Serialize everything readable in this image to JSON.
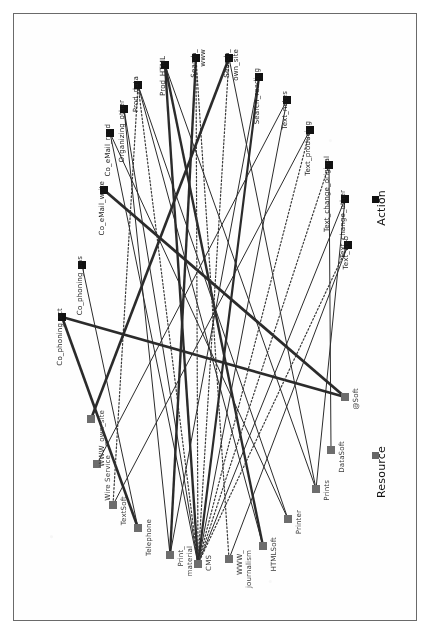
{
  "figure": {
    "orientation": "rotated-90-clockwise",
    "background_color": "#ffffff",
    "frame_color": "#6a6a6a"
  },
  "legend": {
    "items": [
      {
        "label": "Action",
        "marker": "filled-square",
        "color": "#111111",
        "x": 372,
        "y": 196
      },
      {
        "label": "Resource",
        "marker": "filled-square",
        "color": "#666666",
        "x": 372,
        "y": 452
      }
    ]
  },
  "chart_data": {
    "type": "scatter",
    "title": "",
    "xlabel": "",
    "ylabel": "",
    "node_groups": [
      {
        "name": "Action",
        "color": "#111111",
        "marker": "square",
        "size": 8
      },
      {
        "name": "Resource",
        "color": "#6d6d6d",
        "marker": "square",
        "size": 8
      }
    ],
    "nodes": [
      {
        "id": "Co_phoning_act",
        "label": "Co_phoning_act",
        "group": "Action",
        "x": 62,
        "y": 317
      },
      {
        "id": "Co_phoning_pas",
        "label": "Co_phoning_pas",
        "group": "Action",
        "x": 82,
        "y": 265
      },
      {
        "id": "Co_eMail_write",
        "label": "Co_eMail_write",
        "group": "Action",
        "x": 104,
        "y": 190
      },
      {
        "id": "Co_eMail_read",
        "label": "Co_eMail_read",
        "group": "Action",
        "x": 110,
        "y": 133
      },
      {
        "id": "Organizing_other",
        "label": "Organizing_other",
        "group": "Action",
        "x": 124,
        "y": 109
      },
      {
        "id": "Prod_data",
        "label": "Prod_data",
        "group": "Action",
        "x": 138,
        "y": 85
      },
      {
        "id": "Prod_HTML",
        "label": "Prod_HTML",
        "group": "Action",
        "x": 165,
        "y": 65
      },
      {
        "id": "Search_www",
        "label": "Search_www",
        "group": "Action",
        "x": 196,
        "y": 58
      },
      {
        "id": "Search_own_site",
        "label": "Search_own_site",
        "group": "Action",
        "x": 229,
        "y": 58
      },
      {
        "id": "Search_reading",
        "label": "Search_reading",
        "group": "Action",
        "x": 259,
        "y": 77
      },
      {
        "id": "Text_notes",
        "label": "Text_notes",
        "group": "Action",
        "x": 287,
        "y": 100
      },
      {
        "id": "Text_producing",
        "label": "Text_producing",
        "group": "Action",
        "x": 310,
        "y": 130
      },
      {
        "id": "Text_change_original",
        "label": "Text_change_original",
        "group": "Action",
        "x": 329,
        "y": 165
      },
      {
        "id": "Text_change_other",
        "label": "Text_change_other",
        "group": "Action",
        "x": 345,
        "y": 199
      },
      {
        "id": "Text_web",
        "label": "Text_web",
        "group": "Action",
        "x": 348,
        "y": 245
      },
      {
        "id": "WWW_own_site",
        "label": "WWW_own_site",
        "group": "Resource",
        "x": 91,
        "y": 419
      },
      {
        "id": "Wire Service",
        "label": "Wire Service",
        "group": "Resource",
        "x": 97,
        "y": 464
      },
      {
        "id": "TextSoft",
        "label": "TextSoft",
        "group": "Resource",
        "x": 113,
        "y": 505
      },
      {
        "id": "Telephone",
        "label": "Telephone",
        "group": "Resource",
        "x": 138,
        "y": 528
      },
      {
        "id": "Print_material",
        "label": "Print_material",
        "group": "Resource",
        "x": 170,
        "y": 555
      },
      {
        "id": "CMS",
        "label": "CMS",
        "group": "Resource",
        "x": 198,
        "y": 564
      },
      {
        "id": "WWW_journalism",
        "label": "WWW_journalism",
        "group": "Resource",
        "x": 229,
        "y": 559
      },
      {
        "id": "HTMLSoft",
        "label": "HTMLSoft",
        "group": "Resource",
        "x": 263,
        "y": 546
      },
      {
        "id": "Printer",
        "label": "Printer",
        "group": "Resource",
        "x": 288,
        "y": 519
      },
      {
        "id": "Prints",
        "label": "Prints",
        "group": "Resource",
        "x": 316,
        "y": 489
      },
      {
        "id": "DataSoft",
        "label": "DataSoft",
        "group": "Resource",
        "x": 331,
        "y": 450
      },
      {
        "id": "@Soft",
        "label": "@Soft",
        "group": "Resource",
        "x": 345,
        "y": 397
      }
    ],
    "edges": [
      {
        "source": "Co_phoning_act",
        "target": "@Soft",
        "style": "solid",
        "width": 2.6
      },
      {
        "source": "Co_phoning_act",
        "target": "Telephone",
        "style": "solid",
        "width": 2.6
      },
      {
        "source": "Co_phoning_pas",
        "target": "Telephone",
        "style": "solid",
        "width": 1.0
      },
      {
        "source": "Co_eMail_write",
        "target": "@Soft",
        "style": "solid",
        "width": 2.8
      },
      {
        "source": "Co_eMail_read",
        "target": "CMS",
        "style": "solid",
        "width": 1.0
      },
      {
        "source": "Organizing_other",
        "target": "Print_material",
        "style": "solid",
        "width": 1.0
      },
      {
        "source": "Prod_data",
        "target": "CMS",
        "style": "dotted",
        "width": 1.2
      },
      {
        "source": "Prod_data",
        "target": "HTMLSoft",
        "style": "solid",
        "width": 1.0
      },
      {
        "source": "Prod_data",
        "target": "Printer",
        "style": "solid",
        "width": 1.0
      },
      {
        "source": "Prod_data",
        "target": "TextSoft",
        "style": "dotted",
        "width": 1.2
      },
      {
        "source": "Prod_HTML",
        "target": "CMS",
        "style": "solid",
        "width": 2.4
      },
      {
        "source": "Prod_HTML",
        "target": "HTMLSoft",
        "style": "solid",
        "width": 2.4
      },
      {
        "source": "Search_www",
        "target": "CMS",
        "style": "dotted",
        "width": 1.2
      },
      {
        "source": "Search_www",
        "target": "WWW_journalism",
        "style": "dotted",
        "width": 1.2
      },
      {
        "source": "Search_www",
        "target": "Print_material",
        "style": "solid",
        "width": 2.4
      },
      {
        "source": "Search_own_site",
        "target": "CMS",
        "style": "dotted",
        "width": 1.2
      },
      {
        "source": "Search_own_site",
        "target": "WWW_own_site",
        "style": "solid",
        "width": 2.6
      },
      {
        "source": "Search_own_site",
        "target": "Prints",
        "style": "solid",
        "width": 1.0
      },
      {
        "source": "Search_reading",
        "target": "CMS",
        "style": "solid",
        "width": 2.2
      },
      {
        "source": "Text_notes",
        "target": "CMS",
        "style": "solid",
        "width": 1.0
      },
      {
        "source": "Text_notes",
        "target": "Wire Service",
        "style": "solid",
        "width": 1.0
      },
      {
        "source": "Text_producing",
        "target": "CMS",
        "style": "dotted",
        "width": 1.2
      },
      {
        "source": "Text_producing",
        "target": "TextSoft",
        "style": "solid",
        "width": 1.0
      },
      {
        "source": "Text_change_original",
        "target": "CMS",
        "style": "dotted",
        "width": 1.2
      },
      {
        "source": "Text_change_original",
        "target": "DataSoft",
        "style": "solid",
        "width": 1.0
      },
      {
        "source": "Text_change_other",
        "target": "CMS",
        "style": "solid",
        "width": 1.0
      },
      {
        "source": "Text_change_other",
        "target": "Prints",
        "style": "solid",
        "width": 1.0
      },
      {
        "source": "Text_web",
        "target": "CMS",
        "style": "dotted",
        "width": 1.2
      },
      {
        "source": "Text_web",
        "target": "WWW_journalism",
        "style": "solid",
        "width": 1.0
      },
      {
        "source": "Co_eMail_read",
        "target": "Printer",
        "style": "solid",
        "width": 1.0
      },
      {
        "source": "Organizing_other",
        "target": "CMS",
        "style": "solid",
        "width": 1.0
      },
      {
        "source": "Prod_HTML",
        "target": "Prints",
        "style": "solid",
        "width": 1.0
      },
      {
        "source": "Search_reading",
        "target": "Print_material",
        "style": "solid",
        "width": 1.0
      }
    ]
  },
  "labels": {
    "actions": [
      "Co_phoning_act",
      "Co_phoning_pas",
      "Co_eMail_write",
      "Co_eMail_read",
      "Organizing_other",
      "Prod_data",
      "Prod_HTML",
      "Search_www",
      "Search_own_site",
      "Search_reading",
      "Text_notes",
      "Text_producing",
      "Text_change_original",
      "Text_change_other",
      "Text_web"
    ],
    "resources": [
      "WWW_own_site",
      "Wire Service",
      "TextSoft",
      "Telephone",
      "Print_material",
      "CMS",
      "WWW_journalism",
      "HTMLSoft",
      "Printer",
      "Prints",
      "DataSoft",
      "@Soft"
    ]
  }
}
